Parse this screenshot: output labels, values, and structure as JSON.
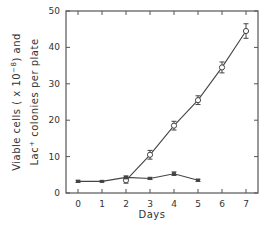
{
  "chart_data": {
    "type": "line",
    "title": "",
    "xlabel": "Days",
    "ylabel_line1": "Viable cells ( x 10^-8 ) and",
    "ylabel_line2": "Lac+ colonies per plate",
    "xlim": [
      -0.5,
      7.5
    ],
    "ylim": [
      0,
      50
    ],
    "x_ticks": [
      "0",
      "1",
      "2",
      "3",
      "4",
      "5",
      "6",
      "7"
    ],
    "y_ticks": [
      "0",
      "10",
      "20",
      "30",
      "40",
      "50"
    ],
    "grid": false,
    "legend": "none",
    "series": [
      {
        "name": "Lac+ colonies per plate",
        "marker": "open-circle",
        "x": [
          2,
          3,
          4,
          5,
          6,
          7
        ],
        "values": [
          3.5,
          10.5,
          18.5,
          25.5,
          34.5,
          44.5
        ],
        "errors": [
          0.8,
          1.2,
          1.2,
          1.2,
          1.5,
          2.0
        ]
      },
      {
        "name": "Viable cells (x 10^-8)",
        "marker": "filled-square",
        "x": [
          0,
          1,
          2,
          3,
          4,
          5
        ],
        "values": [
          3.2,
          3.2,
          4.3,
          4.0,
          5.3,
          3.5
        ],
        "errors": [
          0.3,
          0.2,
          0.4,
          0.3,
          0.5,
          0.3
        ]
      }
    ]
  },
  "labels": {
    "xlabel": "Days",
    "y_main_a": "Viable cells ( x 10",
    "y_main_exp": "−8",
    "y_main_b": ") and",
    "y_sub_a": "Lac",
    "y_sub_sup": "+",
    "y_sub_b": " colonies per plate"
  }
}
